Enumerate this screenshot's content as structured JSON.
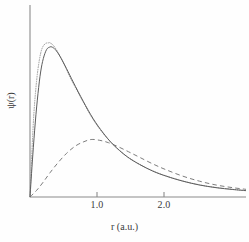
{
  "chart_data": {
    "type": "line",
    "title": "",
    "subtitle": "",
    "xlabel": "r (a.u.)",
    "ylabel": "ψ(r)",
    "xlim": [
      0,
      3.25
    ],
    "ylim": [
      0,
      1.05
    ],
    "xticks": [
      1.0,
      2.0
    ],
    "xticklabels": [
      "1.0",
      "2.0"
    ],
    "yticks": [],
    "yticklabels": [],
    "grid": false,
    "legend": "none",
    "annotations": [],
    "series": [
      {
        "name": "solid-curve",
        "style": "solid",
        "color": "#5d5d5d",
        "peak_x": 0.33,
        "peak_y": 0.9,
        "x": [
          0.0,
          0.04,
          0.08,
          0.12,
          0.16,
          0.2,
          0.25,
          0.3,
          0.33,
          0.38,
          0.45,
          0.55,
          0.65,
          0.8,
          0.95,
          1.1,
          1.25,
          1.45,
          1.65,
          1.85,
          2.05,
          2.3,
          2.55,
          2.8,
          3.05,
          3.25
        ],
        "y": [
          0.0,
          0.24,
          0.45,
          0.62,
          0.75,
          0.83,
          0.885,
          0.9,
          0.9,
          0.885,
          0.845,
          0.77,
          0.69,
          0.575,
          0.47,
          0.385,
          0.315,
          0.245,
          0.195,
          0.155,
          0.125,
          0.095,
          0.072,
          0.056,
          0.045,
          0.038
        ]
      },
      {
        "name": "dotted-curve",
        "style": "dotted",
        "color": "#9a9a9a",
        "peak_x": 0.3,
        "peak_y": 0.925,
        "x": [
          0.0,
          0.03,
          0.06,
          0.1,
          0.14,
          0.18,
          0.23,
          0.28,
          0.3,
          0.35,
          0.42,
          0.52,
          0.62,
          0.78,
          0.93,
          1.08,
          1.25,
          1.45,
          1.65,
          1.85,
          2.05,
          2.3,
          2.55,
          2.8,
          3.05,
          3.25
        ],
        "y": [
          0.0,
          0.28,
          0.51,
          0.7,
          0.82,
          0.89,
          0.92,
          0.925,
          0.925,
          0.91,
          0.868,
          0.79,
          0.705,
          0.585,
          0.478,
          0.392,
          0.316,
          0.246,
          0.196,
          0.156,
          0.126,
          0.096,
          0.073,
          0.057,
          0.046,
          0.039
        ]
      },
      {
        "name": "dashed-curve",
        "style": "dashed",
        "color": "#7d7d7d",
        "peak_x": 0.92,
        "peak_y": 0.345,
        "x": [
          0.0,
          0.1,
          0.2,
          0.3,
          0.42,
          0.55,
          0.68,
          0.8,
          0.92,
          1.05,
          1.18,
          1.32,
          1.48,
          1.65,
          1.85,
          2.05,
          2.3,
          2.55,
          2.8,
          3.05,
          3.25
        ],
        "y": [
          0.0,
          0.04,
          0.09,
          0.145,
          0.205,
          0.262,
          0.305,
          0.33,
          0.345,
          0.34,
          0.326,
          0.303,
          0.272,
          0.238,
          0.198,
          0.163,
          0.125,
          0.095,
          0.072,
          0.056,
          0.046
        ]
      }
    ]
  },
  "axes": {
    "x_tick_labels": [
      "1.0",
      "2.0"
    ],
    "x_axis_label": "r (a.u.)",
    "y_axis_label": "ψ(r)"
  }
}
